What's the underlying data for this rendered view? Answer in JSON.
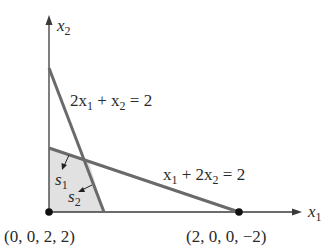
{
  "diagram": {
    "axes": {
      "x_label": "x",
      "x_sub": "1",
      "y_label": "x",
      "y_sub": "2"
    },
    "constraints": [
      {
        "label_parts": [
          "2x",
          "1",
          " + x",
          "2",
          " = 2"
        ],
        "text": "2x1 + x2 = 2"
      },
      {
        "label_parts": [
          "x",
          "1",
          " + 2x",
          "2",
          " = 2"
        ],
        "text": "x1 + 2x2 = 2"
      }
    ],
    "slack_labels": [
      {
        "base": "s",
        "sub": "1"
      },
      {
        "base": "s",
        "sub": "2"
      }
    ],
    "points": [
      {
        "label": "(0, 0, 2, 2)"
      },
      {
        "label": "(2, 0, 0, −2)"
      }
    ],
    "colors": {
      "axis": "#3a3a3a",
      "constraint_line": "#6a6a6a",
      "feasible_fill": "#dcdcdc",
      "point": "#111111"
    }
  }
}
